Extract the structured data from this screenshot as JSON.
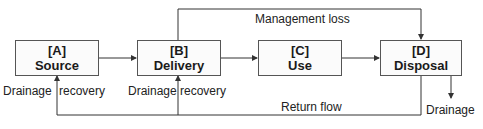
{
  "nodes": [
    {
      "id": "A",
      "code": "[A]",
      "label": "Source"
    },
    {
      "id": "B",
      "code": "[B]",
      "label": "Delivery"
    },
    {
      "id": "C",
      "code": "[C]",
      "label": "Use"
    },
    {
      "id": "D",
      "code": "[D]",
      "label": "Disposal"
    }
  ],
  "edges": {
    "management_loss": "Management loss",
    "return_flow": "Return flow",
    "drainage_recovery_a": "Drainage recovery",
    "drainage_recovery_b": "Drainage recovery",
    "drainage": "Drainage"
  },
  "labels": {
    "drainage_recovery_a_left": "Drainage",
    "drainage_recovery_a_right": "recovery",
    "drainage_recovery_b_left": "Drainage",
    "drainage_recovery_b_right": "recovery"
  },
  "colors": {
    "line": "#333333",
    "box_border": "#555555"
  }
}
